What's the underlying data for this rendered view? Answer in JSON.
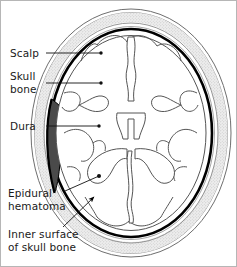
{
  "figure": {
    "border_color": "#b6b6b6",
    "background": "#ffffff"
  },
  "labels": [
    {
      "id": "scalp",
      "text": "Scalp",
      "leader": "line"
    },
    {
      "id": "skull_bone",
      "text": "Skull\nbone",
      "leader": "line"
    },
    {
      "id": "dura",
      "text": "Dura",
      "leader": "line"
    },
    {
      "id": "hematoma",
      "text": "Epidural\nhematoma",
      "leader": "line"
    },
    {
      "id": "inner_surface",
      "text": "Inner surface\nof skull bone",
      "leader": "arrow"
    }
  ],
  "anatomy": {
    "scalp": {
      "name": "scalp-layer",
      "stroke": "#6e6e6e",
      "fill": "#ffffff"
    },
    "skull_bone": {
      "name": "skull-bone-layer",
      "stroke": "#8a8a8a",
      "fill": "#e8e8e8"
    },
    "dura": {
      "name": "dura-layer",
      "stroke": "#000000",
      "fill": "none"
    },
    "brain": {
      "name": "brain-parenchyma",
      "stroke": "#555555",
      "fill": "#ffffff"
    },
    "ventricles": {
      "name": "lateral-ventricles",
      "stroke": "#555555",
      "fill": "#ffffff"
    },
    "hematoma": {
      "name": "epidural-hematoma",
      "stroke": "#000000",
      "fill": "#4a4a4a"
    },
    "midline": {
      "name": "interhemispheric-fissure",
      "stroke": "#555555"
    }
  },
  "colors": {
    "ink": "#1a1a1a",
    "leader": "#111111",
    "bone_fill": "#e8e8e8",
    "hematoma_fill": "#4a4a4a",
    "dura_black": "#000000"
  }
}
